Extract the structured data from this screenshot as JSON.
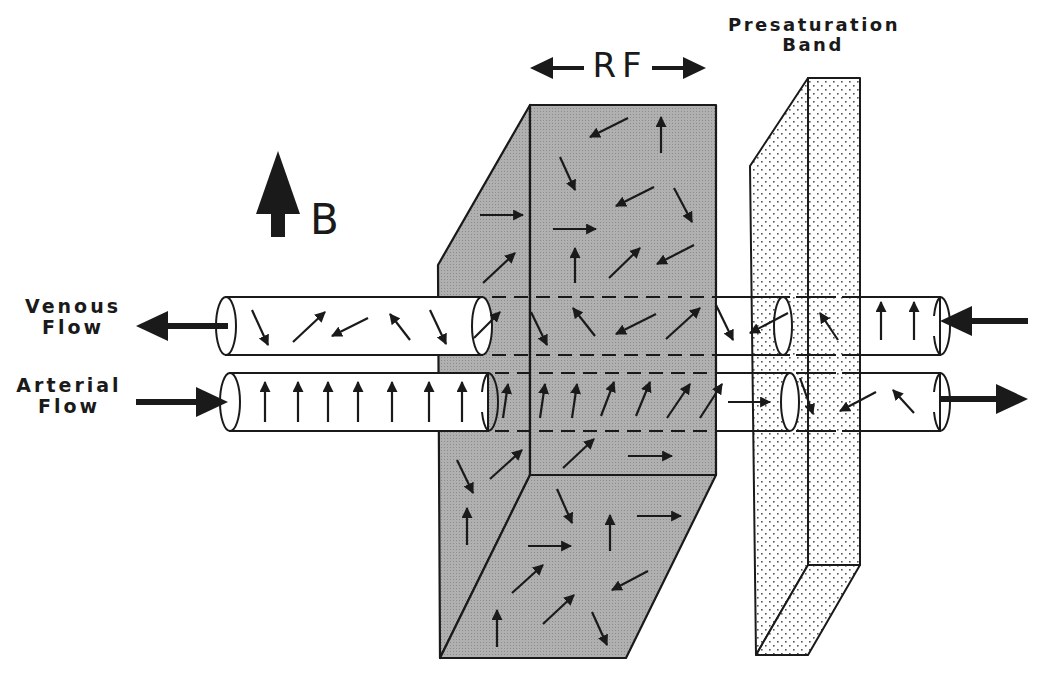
{
  "figure": {
    "type": "schematic"
  },
  "labels": {
    "venous_line1": "Venous",
    "venous_line2": "Flow",
    "arterial_line1": "Arterial",
    "arterial_line2": "Flow",
    "presat_line1": "Presaturation",
    "presat_line2": "Band",
    "rf": "RF",
    "b_field": "B"
  },
  "elements": {
    "rf_slab": {
      "fill": "#a8a8a8",
      "pattern": "fine-grid",
      "description": "imaging slab with randomly oriented spins"
    },
    "presat_band": {
      "fill": "#ffffff",
      "pattern": "dots",
      "dot_color": "#555555"
    },
    "venous_vessel": {
      "flow_direction": "left",
      "entry_side": "right"
    },
    "arterial_vessel": {
      "flow_direction": "right",
      "entry_side": "left"
    },
    "b_arrow": {
      "direction": "up"
    },
    "rf_arrows": {
      "direction": "left-right"
    }
  },
  "colors": {
    "ink": "#1a1a1a",
    "slab_gray": "#a8a8a8",
    "background": "#ffffff"
  }
}
